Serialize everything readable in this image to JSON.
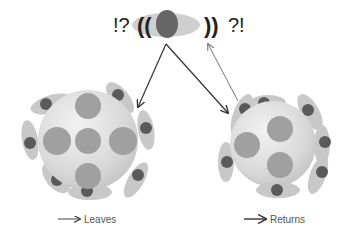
{
  "top": {
    "left_symbols": "!?",
    "left_parens": "((",
    "right_parens": "))",
    "right_symbols": "?!"
  },
  "labels": {
    "leaves": "Leaves",
    "returns": "Returns"
  },
  "colors": {
    "cell_body": "#dcdcdc",
    "inner_circle": "#9a9a9a",
    "satellite_ellipse": "#c8c8c8",
    "satellite_core": "#5a5a5a",
    "arrow_dark": "#333333",
    "arrow_light": "#777777"
  },
  "diagram": {
    "nodes": [
      {
        "id": "signal-cell",
        "desc": "horizontal ellipse with dark core, flanked by sound-wave brackets"
      },
      {
        "id": "left-cell",
        "desc": "large sphere with 5 inner circles and 7 peripheral ellipses"
      },
      {
        "id": "right-cell",
        "desc": "large sphere with 3 inner circles and 7 peripheral ellipses"
      }
    ],
    "edges": [
      {
        "from": "signal-cell",
        "to": "left-cell",
        "style": "dark"
      },
      {
        "from": "signal-cell",
        "to": "right-cell",
        "style": "dark"
      },
      {
        "from": "right-cell",
        "to": "signal-cell",
        "style": "light"
      }
    ]
  }
}
